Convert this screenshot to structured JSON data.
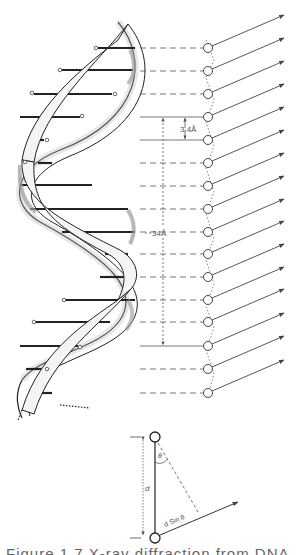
{
  "figure": {
    "labels": {
      "rise_per_base": "3.4Å",
      "helix_pitch": "34Å",
      "spacing": "d",
      "angle": "θ",
      "path_difference": "d Sin θ"
    },
    "base_pair_count": 16,
    "colors": {
      "ink": "#222222",
      "line_gray": "#555555",
      "ribbon_fill": "#f4f4f4",
      "shade": "#9a9a9a",
      "background": "#ffffff"
    }
  },
  "caption": {
    "text": "Figure 1.7   X-ray diffraction from DNA"
  }
}
